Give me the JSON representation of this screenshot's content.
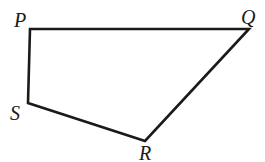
{
  "diagram": {
    "type": "quadrilateral",
    "stroke_color": "#1a1a1a",
    "vertices": [
      {
        "label": "P",
        "x": 30,
        "y": 29,
        "lx": 14,
        "ly": 27
      },
      {
        "label": "Q",
        "x": 249,
        "y": 29,
        "lx": 241,
        "ly": 24
      },
      {
        "label": "R",
        "x": 145,
        "y": 141,
        "lx": 139,
        "ly": 160
      },
      {
        "label": "S",
        "x": 28,
        "y": 103,
        "lx": 10,
        "ly": 120
      }
    ],
    "edges": [
      "PQ",
      "QR",
      "RS",
      "SP"
    ]
  }
}
